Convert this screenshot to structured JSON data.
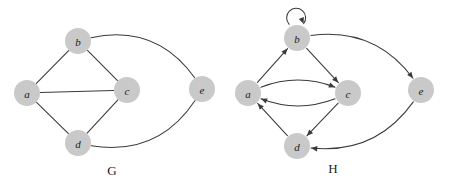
{
  "figure": {
    "type": "graph-diagram",
    "width": 449,
    "height": 188,
    "background_color": "#ffffff",
    "node_fill_color": "#c9c9c9",
    "edge_color": "#3a3a3a",
    "label_color": "#1b1b1b"
  },
  "graphs": [
    {
      "id": "G",
      "caption": "G",
      "caption_position": {
        "x": 112,
        "y": 170
      },
      "directed": false,
      "nodes": [
        {
          "id": "a",
          "label": "a",
          "x": 27,
          "y": 93,
          "r": 13
        },
        {
          "id": "b",
          "label": "b",
          "x": 78,
          "y": 41,
          "r": 13
        },
        {
          "id": "c",
          "label": "c",
          "x": 127,
          "y": 90,
          "r": 13
        },
        {
          "id": "d",
          "label": "d",
          "x": 78,
          "y": 143,
          "r": 13
        },
        {
          "id": "e",
          "label": "e",
          "x": 202,
          "y": 89,
          "r": 13
        }
      ],
      "edges": [
        {
          "from": "a",
          "to": "b",
          "shape": "straight",
          "curvature": 0
        },
        {
          "from": "a",
          "to": "c",
          "shape": "straight",
          "curvature": 0
        },
        {
          "from": "a",
          "to": "d",
          "shape": "straight",
          "curvature": 0
        },
        {
          "from": "b",
          "to": "c",
          "shape": "straight",
          "curvature": 0
        },
        {
          "from": "c",
          "to": "d",
          "shape": "straight",
          "curvature": 0
        },
        {
          "from": "b",
          "to": "e",
          "shape": "curved",
          "curvature": -26
        },
        {
          "from": "d",
          "to": "e",
          "shape": "curved",
          "curvature": 26
        }
      ]
    },
    {
      "id": "H",
      "caption": "H",
      "caption_position": {
        "x": 333,
        "y": 168
      },
      "directed": true,
      "nodes": [
        {
          "id": "a",
          "label": "a",
          "x": 248,
          "y": 93,
          "r": 13
        },
        {
          "id": "b",
          "label": "b",
          "x": 297,
          "y": 38,
          "r": 13
        },
        {
          "id": "c",
          "label": "c",
          "x": 348,
          "y": 93,
          "r": 13
        },
        {
          "id": "d",
          "label": "d",
          "x": 297,
          "y": 146,
          "r": 13
        },
        {
          "id": "e",
          "label": "e",
          "x": 421,
          "y": 90,
          "r": 13
        }
      ],
      "edges": [
        {
          "from": "b",
          "to": "b",
          "shape": "self-loop",
          "curvature": 0
        },
        {
          "from": "a",
          "to": "b",
          "shape": "straight",
          "curvature": 0
        },
        {
          "from": "b",
          "to": "c",
          "shape": "straight",
          "curvature": 0
        },
        {
          "from": "a",
          "to": "c",
          "shape": "curved",
          "curvature": -13
        },
        {
          "from": "c",
          "to": "a",
          "shape": "curved",
          "curvature": -13
        },
        {
          "from": "c",
          "to": "d",
          "shape": "straight",
          "curvature": 0
        },
        {
          "from": "d",
          "to": "a",
          "shape": "straight",
          "curvature": 0
        },
        {
          "from": "b",
          "to": "e",
          "shape": "curved",
          "curvature": -24
        },
        {
          "from": "e",
          "to": "d",
          "shape": "curved",
          "curvature": -24
        }
      ]
    }
  ]
}
